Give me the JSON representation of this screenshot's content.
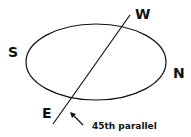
{
  "diagram": {
    "labels": {
      "west": "W",
      "south": "S",
      "north": "N",
      "east": "E",
      "parallel": "45th parallel"
    },
    "colors": {
      "stroke": "#111111",
      "background": "#ffffff"
    }
  }
}
